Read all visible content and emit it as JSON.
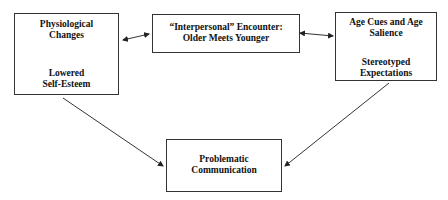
{
  "diagram": {
    "nodes": {
      "physiological": {
        "top_label_line1": "Physiological",
        "top_label_line2": "Changes",
        "bottom_label_line1": "Lowered",
        "bottom_label_line2": "Self-Esteem"
      },
      "encounter": {
        "line1": "“Interpersonal” Encounter:",
        "line2": "Older Meets Younger"
      },
      "age_cues": {
        "top_label_line1": "Age Cues and Age",
        "top_label_line2": "Salience",
        "bottom_label_line1": "Stereotyped",
        "bottom_label_line2": "Expectations"
      },
      "problematic": {
        "line1": "Problematic",
        "line2": "Communication"
      }
    },
    "edges": [
      {
        "from": "physiological.top",
        "to": "physiological.bottom",
        "type": "arrow"
      },
      {
        "from": "age_cues.top",
        "to": "age_cues.bottom",
        "type": "arrow"
      },
      {
        "from": "physiological",
        "to": "encounter",
        "type": "bidirectional"
      },
      {
        "from": "encounter",
        "to": "age_cues",
        "type": "bidirectional"
      },
      {
        "from": "physiological",
        "to": "problematic",
        "type": "arrow"
      },
      {
        "from": "age_cues",
        "to": "problematic",
        "type": "arrow"
      }
    ],
    "colors": {
      "line": "#333333",
      "background": "#ffffff",
      "text": "#111111"
    }
  }
}
